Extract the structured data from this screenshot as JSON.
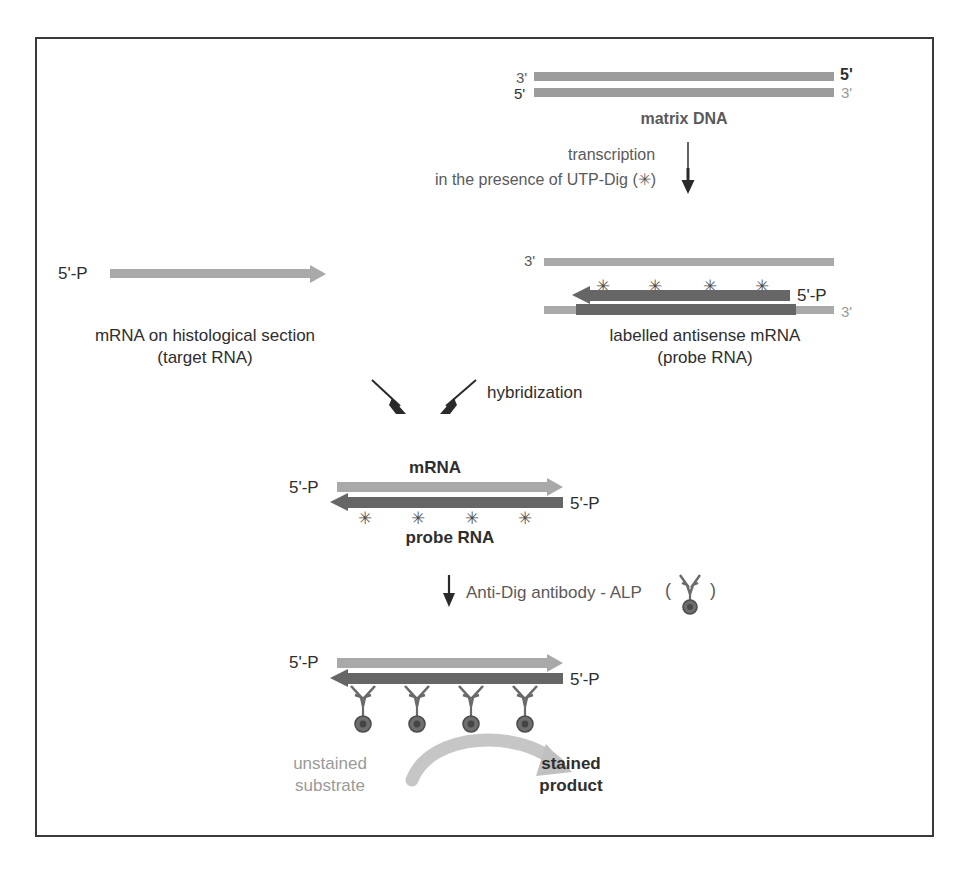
{
  "steps": {
    "matrix_dna": {
      "caption": "matrix DNA",
      "left_top_label": "3'",
      "left_bottom_label": "5'",
      "right_top_label": "5'",
      "right_bottom_label": "3'"
    },
    "transcription": {
      "line1": "transcription",
      "line2": "in the presence of UTP-Dig (✳)"
    },
    "target": {
      "five_prime_label": "5'-P",
      "caption_line1": "mRNA on histological section",
      "caption_line2": "(target RNA)"
    },
    "probe": {
      "template_left_label": "3'",
      "probe_right_label": "5'-P",
      "template_right_label": "3'",
      "caption_line1": "labelled antisense mRNA",
      "caption_line2": "(probe RNA)",
      "label_marks": [
        "✳",
        "✳",
        "✳",
        "✳"
      ]
    },
    "hybridization": {
      "label": "hybridization"
    },
    "hybrid": {
      "mrna_label": "mRNA",
      "probe_label": "probe RNA",
      "left_five_prime": "5'-P",
      "right_five_prime": "5'-P",
      "label_marks": [
        "✳",
        "✳",
        "✳",
        "✳"
      ]
    },
    "antibody": {
      "label": "Anti-Dig antibody - ALP",
      "paren_open": "(",
      "paren_close": ")"
    },
    "detection": {
      "left_five_prime": "5'-P",
      "right_five_prime": "5'-P",
      "unstained_line1": "unstained",
      "unstained_line2": "substrate",
      "stained_line1": "stained",
      "stained_line2": "product"
    }
  },
  "colors": {
    "frame": "#3a3a3a",
    "light_strand": "#a9a9a9",
    "dark_strand": "#666666",
    "text_dark": "#2e2e2e",
    "text_mid": "#5a5a5a",
    "text_light": "#9a9a9a"
  }
}
